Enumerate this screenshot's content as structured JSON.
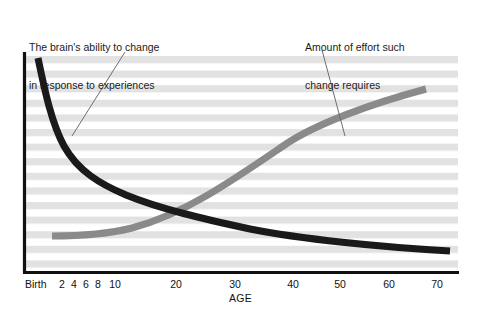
{
  "chart_data": {
    "type": "line",
    "title": "",
    "subtitle": "",
    "xlabel": "AGE",
    "ylabel": "",
    "xlim": [
      0,
      75
    ],
    "ylim": [
      0,
      100
    ],
    "grid": "horizontal-banded-stripes",
    "legend_position": "none",
    "tick_labels": [
      {
        "text": "Birth",
        "value": 0
      },
      {
        "text": "2",
        "value": 2
      },
      {
        "text": "4",
        "value": 4
      },
      {
        "text": "6",
        "value": 6
      },
      {
        "text": "8",
        "value": 8
      },
      {
        "text": "10",
        "value": 10
      },
      {
        "text": "20",
        "value": 20
      },
      {
        "text": "30",
        "value": 30
      },
      {
        "text": "40",
        "value": 40
      },
      {
        "text": "50",
        "value": 50
      },
      {
        "text": "60",
        "value": 60
      },
      {
        "text": "70",
        "value": 70
      }
    ],
    "series": [
      {
        "name": "The brain's ability to change in response to experiences",
        "color": "#1a1a1a",
        "shape": "decaying-curve",
        "x": [
          1,
          2,
          3,
          5,
          7,
          10,
          15,
          20,
          25,
          30,
          40,
          50,
          60,
          70,
          73
        ],
        "values": [
          97,
          88,
          79,
          65,
          56,
          47,
          39,
          34,
          30,
          27,
          22,
          18,
          14,
          10,
          9
        ]
      },
      {
        "name": "Amount of effort such change requires",
        "color": "#8a8a8a",
        "shape": "rising-curve",
        "x": [
          3,
          6,
          10,
          14,
          18,
          22,
          26,
          30,
          40,
          50,
          60,
          67
        ],
        "values": [
          12,
          12,
          13,
          16,
          21,
          27,
          33,
          39,
          53,
          66,
          80,
          88
        ]
      }
    ],
    "annotations": [
      {
        "id": "brain-ability",
        "line1": "The brain's ability to change",
        "line2": "in response to experiences",
        "leader_from": [
          125,
          52
        ],
        "leader_to": [
          72,
          136
        ]
      },
      {
        "id": "effort-required",
        "line1": "Amount of effort such",
        "line2": "change requires",
        "leader_from": [
          322,
          50
        ],
        "leader_to": [
          345,
          136
        ]
      }
    ],
    "colors": {
      "axis": "#111111",
      "stripe": "#e0e0e0",
      "background": "#ffffff",
      "black_curve": "#1a1a1a",
      "gray_curve": "#8a8a8a",
      "leader_line": "#6e6e6e",
      "text": "#111111"
    }
  }
}
